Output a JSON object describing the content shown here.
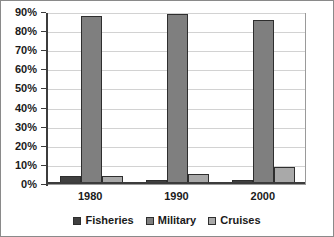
{
  "chart_data": {
    "type": "bar",
    "title": "",
    "subtitle": "",
    "xlabel": "",
    "ylabel": "",
    "categories": [
      "1980",
      "1990",
      "2000"
    ],
    "series": [
      {
        "name": "Fisheries",
        "values": [
          4,
          2,
          2
        ],
        "color": "#404040"
      },
      {
        "name": "Military",
        "values": [
          88,
          89,
          86
        ],
        "color": "#7f7f7f"
      },
      {
        "name": "Cruises",
        "values": [
          4,
          5,
          9
        ],
        "color": "#a9a9a9"
      }
    ],
    "ylim": [
      0,
      90
    ],
    "ytick_values": [
      0,
      10,
      20,
      30,
      40,
      50,
      60,
      70,
      80,
      90
    ],
    "ytick_labels": [
      "0%",
      "10%",
      "20%",
      "30%",
      "40%",
      "50%",
      "60%",
      "70%",
      "80%",
      "90%"
    ],
    "grid": true,
    "grid_axis": "y",
    "legend_position": "bottom",
    "legend_orientation": "horizontal",
    "value_unit": "%",
    "plot_background": "#ffffff",
    "figure_background": "#ffffff",
    "border_color": "#8a8a8a"
  },
  "axes": {
    "y": {
      "ticks": [
        {
          "label": "90%",
          "value": 90
        },
        {
          "label": "80%",
          "value": 80
        },
        {
          "label": "70%",
          "value": 70
        },
        {
          "label": "60%",
          "value": 60
        },
        {
          "label": "50%",
          "value": 50
        },
        {
          "label": "40%",
          "value": 40
        },
        {
          "label": "30%",
          "value": 30
        },
        {
          "label": "20%",
          "value": 20
        },
        {
          "label": "10%",
          "value": 10
        },
        {
          "label": "0%",
          "value": 0
        }
      ]
    },
    "x": {
      "ticks": [
        {
          "label": "1980"
        },
        {
          "label": "1990"
        },
        {
          "label": "2000"
        }
      ]
    }
  },
  "legend": {
    "items": [
      {
        "label": "Fisheries",
        "color": "#404040"
      },
      {
        "label": "Military",
        "color": "#7f7f7f"
      },
      {
        "label": "Cruises",
        "color": "#a9a9a9"
      }
    ]
  }
}
